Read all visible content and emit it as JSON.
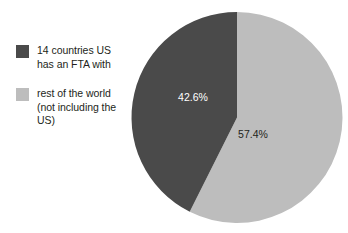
{
  "legend": {
    "items": [
      {
        "label": "14 countries US\nhas an FTA with",
        "color": "#4a4a4a",
        "swatch_name": "legend-swatch-dark"
      },
      {
        "label": "rest of the world\n(not including the\nUS)",
        "color": "#bdbdbd",
        "swatch_name": "legend-swatch-light"
      }
    ]
  },
  "labels": {
    "dark_slice": "42.6%",
    "light_slice": "57.4%"
  },
  "chart_data": {
    "type": "pie",
    "title": "",
    "categories": [
      "14 countries US has an FTA with",
      "rest of the world (not including the US)"
    ],
    "values": [
      42.6,
      57.4
    ],
    "value_labels": [
      "42.6%",
      "57.4%"
    ],
    "colors": [
      "#4a4a4a",
      "#bdbdbd"
    ],
    "units": "percent",
    "total": 100,
    "start_angle_deg": 0,
    "direction": "clockwise",
    "legend_position": "left",
    "grid": false,
    "slice_order": [
      "rest of the world (not including the US)",
      "14 countries US has an FTA with"
    ]
  }
}
